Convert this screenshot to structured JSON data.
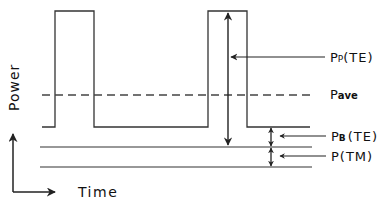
{
  "diagram": {
    "axes": {
      "y_label": "Power",
      "x_label": "Time"
    },
    "labels": {
      "peak_main": "P",
      "peak_sub": "P",
      "peak_suffix": "(TE)",
      "average_main": "P",
      "average_sub": "ave",
      "base_main": "P",
      "base_sub": "B",
      "base_suffix": "(TE)",
      "tm_main": "P",
      "tm_suffix": "(TM)"
    },
    "colors": {
      "stroke": "#222222",
      "background": "#ffffff"
    }
  }
}
